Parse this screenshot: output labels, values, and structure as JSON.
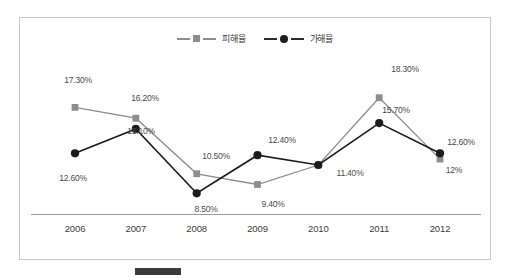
{
  "chart_data": {
    "type": "line",
    "title": "",
    "subtitle": "",
    "xlabel": "",
    "ylabel": "",
    "grid": false,
    "legend_position": "top-center",
    "categories": [
      "2006",
      "2007",
      "2008",
      "2009",
      "2010",
      "2011",
      "2012"
    ],
    "ylim": [
      7.5,
      19.5
    ],
    "series": [
      {
        "name": "피해율",
        "marker": "square",
        "color": "#8d8d8d",
        "values": [
          17.3,
          16.2,
          10.5,
          9.4,
          11.4,
          18.3,
          12.0
        ],
        "labels": [
          "17.30%",
          "16.20%",
          "10.50%",
          "9.40%",
          "11.40%",
          "18.30%",
          "12%"
        ]
      },
      {
        "name": "가해율",
        "marker": "circle",
        "color": "#1c1c1c",
        "values": [
          12.6,
          15.1,
          8.5,
          12.4,
          11.4,
          15.7,
          12.6
        ],
        "labels": [
          "12.60%",
          "15.10%",
          "8.50%",
          "12.40%",
          "11.40%",
          "15.70%",
          "12.60%"
        ]
      }
    ]
  },
  "legend": {
    "entries": [
      {
        "label": "피해율"
      },
      {
        "label": "가해율"
      }
    ]
  },
  "axis": {
    "ticks": [
      "2006",
      "2007",
      "2008",
      "2009",
      "2010",
      "2011",
      "2012"
    ]
  },
  "data_labels": [
    {
      "text": "17.30%",
      "x": 58,
      "y": 62
    },
    {
      "text": "16.20%",
      "x": 125,
      "y": 80
    },
    {
      "text": "12.60%",
      "x": 53,
      "y": 160
    },
    {
      "text": "15.10%",
      "x": 121,
      "y": 113
    },
    {
      "text": "10.50%",
      "x": 196,
      "y": 138
    },
    {
      "text": "8.50%",
      "x": 186,
      "y": 191
    },
    {
      "text": "12.40%",
      "x": 262,
      "y": 122
    },
    {
      "text": "9.40%",
      "x": 253,
      "y": 186
    },
    {
      "text": "11.40%",
      "x": 330,
      "y": 155
    },
    {
      "text": "18.30%",
      "x": 385,
      "y": 51
    },
    {
      "text": "15.70%",
      "x": 376,
      "y": 92
    },
    {
      "text": "12.60%",
      "x": 441,
      "y": 124
    },
    {
      "text": "12%",
      "x": 434,
      "y": 152
    }
  ],
  "caption": {
    "text": ""
  }
}
